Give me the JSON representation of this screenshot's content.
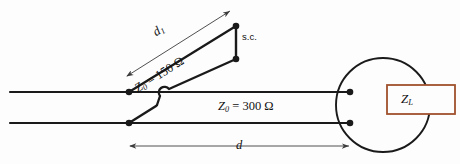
{
  "figure": {
    "background_color": "#fdfdfd",
    "line_color": "#1a1a1a",
    "dimension_line_color": "#4a4a4a",
    "load_box_color": "#a0522d"
  },
  "labels": {
    "stub_length": "d",
    "stub_length_sub": "1",
    "short_circuit": "s.c.",
    "stub_impedance_symbol": "Z",
    "stub_impedance_sub": "0",
    "stub_impedance_value": " = 150 Ω",
    "main_impedance_symbol": "Z",
    "main_impedance_sub": "0",
    "main_impedance_value": " = 300 Ω",
    "main_length": "d",
    "load_symbol": "Z",
    "load_sub": "L"
  },
  "values": {
    "stub_characteristic_impedance_ohms": 150,
    "line_characteristic_impedance_ohms": 300
  },
  "geometry": {
    "top_line_y": 92,
    "bottom_line_y": 123,
    "junction_x": 129,
    "terminal_x": 350,
    "stub_top_x": 236,
    "stub_top_y": 26,
    "stub_bottom_y": 59,
    "circle_center_x": 383,
    "circle_center_y": 105,
    "circle_radius": 47,
    "load_box": {
      "x": 387,
      "y": 85,
      "width": 68,
      "height": 29
    }
  }
}
